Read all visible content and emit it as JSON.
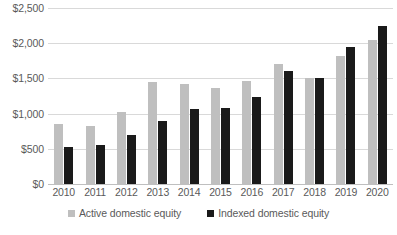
{
  "chart_data": {
    "type": "bar",
    "title": "",
    "subtitle": "",
    "xlabel": "",
    "ylabel": "",
    "categories": [
      "2010",
      "2011",
      "2012",
      "2013",
      "2014",
      "2015",
      "2016",
      "2017",
      "2018",
      "2019",
      "2020"
    ],
    "series": [
      {
        "name": "Active domestic equity",
        "color": "#BFBFBF",
        "values": [
          850,
          820,
          1030,
          1450,
          1420,
          1360,
          1460,
          1700,
          1500,
          1820,
          2050
        ]
      },
      {
        "name": "Indexed domestic equity",
        "color": "#1A1A1A",
        "values": [
          520,
          560,
          700,
          900,
          1060,
          1080,
          1240,
          1600,
          1500,
          1950,
          2250
        ]
      }
    ],
    "ylim": [
      0,
      2500
    ],
    "ytick_values": [
      0,
      500,
      1000,
      1500,
      2000,
      2500
    ],
    "ytick_labels": [
      "$0",
      "$500",
      "$1,000",
      "$1,500",
      "$2,000",
      "$2,500"
    ],
    "grid": true,
    "grid_axis": "y",
    "legend_position": "bottom",
    "legend": [
      "Active domestic equity",
      "Indexed domestic equity"
    ],
    "annotations": []
  },
  "axes": {
    "y_ticks": [
      {
        "label": "$2,500",
        "value": 2500
      },
      {
        "label": "$2,000",
        "value": 2000
      },
      {
        "label": "$1,500",
        "value": 1500
      },
      {
        "label": "$1,000",
        "value": 1000
      },
      {
        "label": "$500",
        "value": 500
      },
      {
        "label": "$0",
        "value": 0
      }
    ],
    "x_ticks": [
      "2010",
      "2011",
      "2012",
      "2013",
      "2014",
      "2015",
      "2016",
      "2017",
      "2018",
      "2019",
      "2020"
    ]
  },
  "legend": {
    "items": [
      {
        "label": "Active domestic equity",
        "swatch": "legend-swatch-active"
      },
      {
        "label": "Indexed domestic equity",
        "swatch": "legend-swatch-indexed"
      }
    ]
  },
  "colors": {
    "active": "#BFBFBF",
    "indexed": "#1A1A1A",
    "gridline": "#D9D9D9",
    "baseline": "#BFBFBF",
    "text": "#5A5A5A",
    "background": "#FFFFFF"
  }
}
